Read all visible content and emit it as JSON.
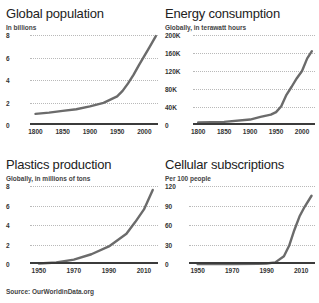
{
  "source_note": "Source: OurWorldinData.org",
  "accent_color": "#6b6b6b",
  "axis_color": "#3b3b3b",
  "chart_data": [
    {
      "id": "global-population",
      "type": "line",
      "title": "Global population",
      "subtitle": "In billions",
      "xlabel": "",
      "ylabel": "In billions",
      "xlim": [
        1790,
        2025
      ],
      "ylim": [
        0,
        8
      ],
      "yticks": [
        0,
        2,
        4,
        6,
        8
      ],
      "ytick_labels": [
        "0",
        "2",
        "4",
        "6",
        "8"
      ],
      "xticks": [
        1800,
        1850,
        1900,
        1950,
        2000
      ],
      "xtick_labels": [
        "1800",
        "1850",
        "1900",
        "1950",
        "2000"
      ],
      "grid": true,
      "legend": "none",
      "x": [
        1800,
        1825,
        1850,
        1875,
        1900,
        1925,
        1950,
        1960,
        1970,
        1980,
        1990,
        2000,
        2010,
        2021
      ],
      "values": [
        0.99,
        1.1,
        1.26,
        1.4,
        1.65,
        1.97,
        2.54,
        3.03,
        3.7,
        4.46,
        5.33,
        6.14,
        6.96,
        7.9
      ]
    },
    {
      "id": "energy-consumption",
      "type": "line",
      "title": "Energy consumption",
      "subtitle": "Globally, in terawatt hours",
      "xlabel": "",
      "ylabel": "Globally, in terawatt hours",
      "xlim": [
        1790,
        2025
      ],
      "ylim": [
        0,
        200000
      ],
      "yticks": [
        0,
        40000,
        80000,
        120000,
        160000,
        200000
      ],
      "ytick_labels": [
        "0",
        "40K",
        "80K",
        "120K",
        "160K",
        "200K"
      ],
      "xticks": [
        1800,
        1850,
        1900,
        1950,
        2000
      ],
      "xtick_labels": [
        "1800",
        "1850",
        "1900",
        "1950",
        "2000"
      ],
      "grid": true,
      "legend": "none",
      "x": [
        1800,
        1850,
        1900,
        1920,
        1940,
        1950,
        1960,
        1970,
        1980,
        1990,
        2000,
        2010,
        2019
      ],
      "values": [
        5600,
        7000,
        12100,
        18000,
        22900,
        28600,
        41800,
        67000,
        85000,
        104000,
        120000,
        148000,
        164000
      ]
    },
    {
      "id": "plastics-production",
      "type": "line",
      "title": "Plastics production",
      "subtitle": "Globally, in millions of tons",
      "xlabel": "",
      "ylabel": "Globally, in millions of tons",
      "xlim": [
        1945,
        2018
      ],
      "ylim": [
        0,
        8
      ],
      "yticks": [
        0,
        2,
        4,
        6,
        8
      ],
      "ytick_labels": [
        "0",
        "2",
        "4",
        "6",
        "8"
      ],
      "xticks": [
        1950,
        1970,
        1990,
        2010
      ],
      "xtick_labels": [
        "1950",
        "1970",
        "1990",
        "2010"
      ],
      "grid": true,
      "legend": "none",
      "x": [
        1950,
        1960,
        1970,
        1980,
        1990,
        2000,
        2005,
        2010,
        2015
      ],
      "values": [
        0.05,
        0.15,
        0.45,
        1.0,
        1.8,
        3.1,
        4.3,
        5.6,
        7.6
      ]
    },
    {
      "id": "cellular-subscriptions",
      "type": "line",
      "title": "Cellular subscriptions",
      "subtitle": "Per 100 people",
      "xlabel": "",
      "ylabel": "Per 100 people",
      "xlim": [
        1945,
        2018
      ],
      "ylim": [
        0,
        120
      ],
      "yticks": [
        0,
        30,
        60,
        90,
        120
      ],
      "ytick_labels": [
        "0",
        "30",
        "60",
        "90",
        "120"
      ],
      "xticks": [
        1950,
        1970,
        1990,
        2010
      ],
      "xtick_labels": [
        "1950",
        "1970",
        "1990",
        "2010"
      ],
      "grid": true,
      "legend": "none",
      "x": [
        1950,
        1970,
        1985,
        1990,
        1995,
        2000,
        2003,
        2006,
        2009,
        2012,
        2016
      ],
      "values": [
        0,
        0,
        0.2,
        0.8,
        2.5,
        12,
        28,
        52,
        73,
        88,
        105
      ]
    }
  ]
}
